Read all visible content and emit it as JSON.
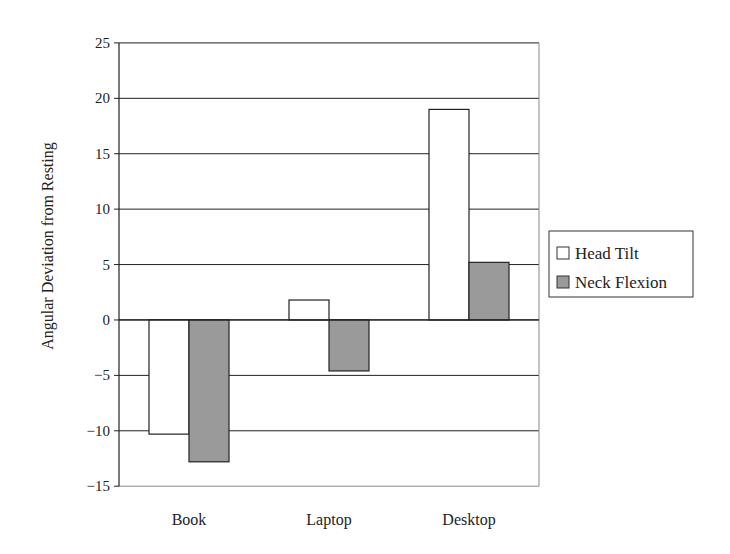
{
  "chart_data": {
    "type": "bar",
    "title": "",
    "xlabel": "",
    "ylabel": "Angular Deviation from Resting",
    "categories": [
      "Book",
      "Laptop",
      "Desktop"
    ],
    "series": [
      {
        "name": "Head Tilt",
        "values": [
          -10.3,
          1.8,
          19.0
        ],
        "color": "#ffffff"
      },
      {
        "name": "Neck Flexion",
        "values": [
          -12.8,
          -4.6,
          5.2
        ],
        "color": "#9a9a9a"
      }
    ],
    "ylim": [
      -15,
      25
    ],
    "yticks": [
      25,
      20,
      15,
      10,
      5,
      0,
      -5,
      -10,
      -15
    ],
    "ytick_labels": [
      "25",
      "20",
      "15",
      "10",
      "5",
      "0",
      "−5",
      "−10",
      "−15"
    ],
    "grid": true,
    "legend_position": "right"
  },
  "legend": {
    "items": [
      {
        "label": "Head Tilt"
      },
      {
        "label": "Neck Flexion"
      }
    ]
  }
}
